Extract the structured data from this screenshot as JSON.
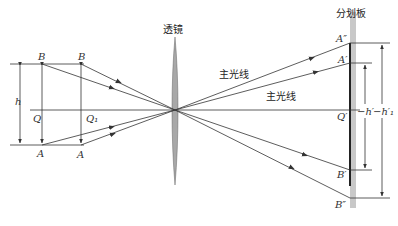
{
  "diagram": {
    "title_lens": "透镜",
    "title_reticle": "分划板",
    "chief_ray_label_1": "主光线",
    "chief_ray_label_2": "主光线",
    "labels": {
      "B_left": "B",
      "B_right": "B",
      "A_left": "A",
      "A_right": "A",
      "h": "h",
      "Q": "Q",
      "Q1": "Q₁",
      "A_double_prime": "A″",
      "A_prime": "A′",
      "Q_prime": "Q′",
      "B_prime": "B′",
      "B_double_prime": "B″",
      "h_prime": "−h′",
      "h1_prime": "−h′₁"
    },
    "colors": {
      "line": "#333333",
      "lens_fill": "#a8a8a8",
      "reticle_band": "#c8c8c8",
      "reticle_line": "#222222"
    }
  }
}
